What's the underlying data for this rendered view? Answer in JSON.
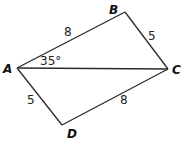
{
  "diagram": {
    "type": "quadrilateral",
    "vertices": {
      "A": {
        "label": "A",
        "x": 17,
        "y": 68
      },
      "B": {
        "label": "B",
        "x": 125,
        "y": 12
      },
      "C": {
        "label": "C",
        "x": 168,
        "y": 69
      },
      "D": {
        "label": "D",
        "x": 62,
        "y": 125
      }
    },
    "edges": [
      {
        "from": "A",
        "to": "B",
        "length_label": "8"
      },
      {
        "from": "B",
        "to": "C",
        "length_label": "5"
      },
      {
        "from": "C",
        "to": "D",
        "length_label": "8"
      },
      {
        "from": "D",
        "to": "A",
        "length_label": "5"
      },
      {
        "from": "A",
        "to": "C",
        "length_label": ""
      }
    ],
    "angle": {
      "vertex": "A",
      "between": [
        "B",
        "C"
      ],
      "label": "35°"
    },
    "colors": {
      "stroke": "#2a2a2a",
      "text": "#111111",
      "background": "#ffffff"
    }
  }
}
